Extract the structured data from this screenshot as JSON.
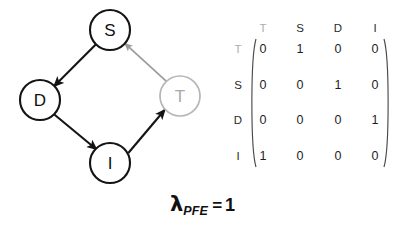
{
  "figure": {
    "graph": {
      "nodes": [
        {
          "id": "S",
          "label": "S",
          "cx": 110,
          "cy": 30,
          "r": 20,
          "style": "dark"
        },
        {
          "id": "D",
          "label": "D",
          "cx": 40,
          "cy": 100,
          "r": 20,
          "style": "dark"
        },
        {
          "id": "I",
          "label": "I",
          "cx": 110,
          "cy": 163,
          "r": 20,
          "style": "dark"
        },
        {
          "id": "T",
          "label": "T",
          "cx": 180,
          "cy": 96,
          "r": 20,
          "style": "faded"
        }
      ],
      "edges": [
        {
          "from": "S",
          "to": "D",
          "style": "dark"
        },
        {
          "from": "D",
          "to": "I",
          "style": "dark"
        },
        {
          "from": "I",
          "to": "T",
          "style": "dark"
        },
        {
          "from": "T",
          "to": "S",
          "style": "faded"
        }
      ]
    },
    "matrix": {
      "col_headers": [
        "T",
        "S",
        "D",
        "I"
      ],
      "row_labels": [
        "T",
        "S",
        "D",
        "I"
      ],
      "faded_header": "T",
      "faded_row_label": "T",
      "rows": [
        [
          "0",
          "1",
          "0",
          "0"
        ],
        [
          "0",
          "0",
          "1",
          "0"
        ],
        [
          "0",
          "0",
          "0",
          "1"
        ],
        [
          "1",
          "0",
          "0",
          "0"
        ]
      ]
    },
    "caption": {
      "symbol": "λ",
      "subscript": "PFE",
      "equals": "=",
      "value": "1"
    },
    "colors": {
      "dark_stroke": "#141414",
      "faded_stroke": "#b6b6b6",
      "text_dark": "#111111",
      "text_faded": "#a8a8a8",
      "background": "#ffffff"
    }
  }
}
